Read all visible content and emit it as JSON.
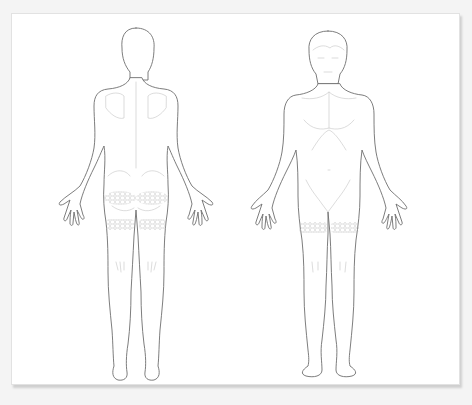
{
  "figure": {
    "type": "body-map illustration",
    "views": [
      {
        "id": "posterior",
        "label": "Back view"
      },
      {
        "id": "anterior",
        "label": "Front view"
      }
    ],
    "highlighted_regions": [
      {
        "view": "posterior",
        "region": "left buttock"
      },
      {
        "view": "posterior",
        "region": "right buttock"
      },
      {
        "view": "posterior",
        "region": "upper thighs (posterior band)"
      },
      {
        "view": "anterior",
        "region": "upper thighs (anterior band)"
      }
    ],
    "colors": {
      "outline": "#6e6e6e",
      "detail": "#c4c4c4",
      "hatch": "#bdbdbd",
      "panel": "#ffffff",
      "background": "#f4f4f4"
    }
  },
  "caption": ""
}
